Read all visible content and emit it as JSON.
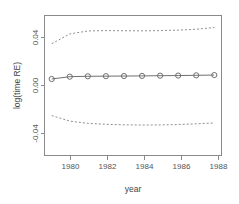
{
  "chart_data": {
    "type": "line",
    "title": "",
    "xlabel": "year",
    "ylabel": "log(time RE)",
    "xlim": [
      1978.6,
      1988.4
    ],
    "ylim": [
      -0.058,
      0.056
    ],
    "xticks": [
      1980,
      1982,
      1984,
      1986,
      1988
    ],
    "xtick_labels": [
      "1980",
      "1982",
      "1984",
      "1986",
      "1988"
    ],
    "yticks": [
      -0.04,
      0.0,
      0.04
    ],
    "ytick_labels": [
      "-0.04",
      "0.00",
      "0.04"
    ],
    "grid": false,
    "legend": null,
    "x": [
      1979,
      1980,
      1981,
      1982,
      1983,
      1984,
      1985,
      1986,
      1987,
      1988
    ],
    "series": [
      {
        "name": "estimate",
        "style": "solid",
        "marker": "circle",
        "values": [
          0.0043,
          0.0062,
          0.0065,
          0.0066,
          0.0067,
          0.0068,
          0.007,
          0.0071,
          0.0073,
          0.0075
        ]
      },
      {
        "name": "upper-confidence-band",
        "style": "dashed",
        "marker": "none",
        "values": [
          0.033,
          0.041,
          0.0434,
          0.0437,
          0.0436,
          0.0435,
          0.0437,
          0.0441,
          0.0448,
          0.0462
        ]
      },
      {
        "name": "lower-confidence-band",
        "style": "dashed",
        "marker": "none",
        "values": [
          -0.0255,
          -0.03,
          -0.0318,
          -0.0326,
          -0.033,
          -0.0332,
          -0.0331,
          -0.0328,
          -0.0322,
          -0.0315
        ]
      }
    ]
  }
}
